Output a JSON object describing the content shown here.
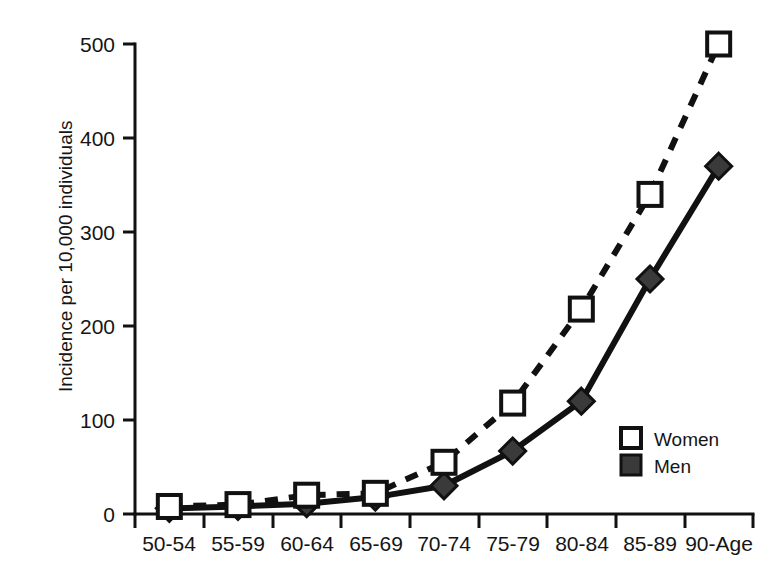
{
  "chart_data": {
    "type": "line",
    "title": "",
    "subtitle": "",
    "xlabel": "",
    "ylabel": "Incidence per 10,000 individuals",
    "categories": [
      "50-54",
      "55-59",
      "60-64",
      "65-69",
      "70-74",
      "75-79",
      "80-84",
      "85-89",
      "90-Age"
    ],
    "series": [
      {
        "name": "Women",
        "marker": "open-square",
        "linestyle": "dashed",
        "values": [
          8,
          10,
          20,
          22,
          55,
          118,
          218,
          340,
          500
        ]
      },
      {
        "name": "Men",
        "marker": "filled-diamond",
        "linestyle": "solid",
        "values": [
          6,
          8,
          11,
          18,
          30,
          67,
          120,
          250,
          370
        ]
      }
    ],
    "ylim": [
      0,
      500
    ],
    "yticks": [
      0,
      100,
      200,
      300,
      400,
      500
    ],
    "ytick_labels": [
      "0",
      "100",
      "200",
      "300",
      "400",
      "500"
    ],
    "grid": false,
    "legend_position": "lower-right",
    "colors": {
      "ink": "#111111",
      "men_fill": "#3a3a3a",
      "women_fill": "#ffffff",
      "background": "#ffffff"
    }
  },
  "axes": {
    "y_axis_title": "Incidence per 10,000 individuals"
  },
  "legend": {
    "entries": [
      {
        "label": "Women",
        "swatch": "open-square"
      },
      {
        "label": "Men",
        "swatch": "filled-square"
      }
    ]
  }
}
